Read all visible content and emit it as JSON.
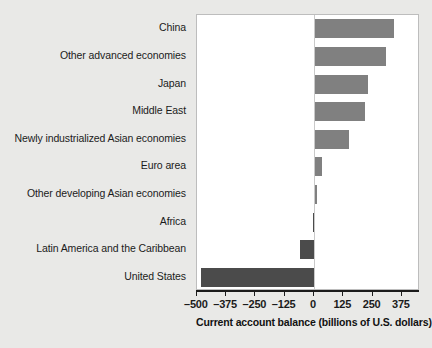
{
  "chart_data": {
    "type": "bar",
    "orientation": "horizontal",
    "title": "",
    "subtitle": "",
    "xlabel": "Current account balance (billions of U.S. dollars)",
    "ylabel": "",
    "xlim": [
      -500,
      432
    ],
    "xticks": [
      -500,
      -375,
      -250,
      -125,
      0,
      125,
      250,
      375
    ],
    "xtick_labels": [
      "–500",
      "–375",
      "–250",
      "–125",
      "0",
      "125",
      "250",
      "375"
    ],
    "grid": false,
    "legend": null,
    "zero_line": 0,
    "categories": [
      "China",
      "Other advanced economies",
      "Japan",
      "Middle East",
      "Newly industrialized Asian economies",
      "Euro area",
      "Other developing Asian economies",
      "Africa",
      "Latin America and the Caribbean",
      "United States"
    ],
    "values": [
      337,
      305,
      225,
      215,
      145,
      30,
      10,
      -5,
      -60,
      -480
    ],
    "colors": {
      "positive_bar": "#808080",
      "negative_bar": "#4b4b4b",
      "plot_background": "#ffffff",
      "page_background": "#e9e9e7",
      "axis": "#1b1b1b",
      "zero_line": "#c9c9c9",
      "plot_border": "#bdbdbd",
      "text": "#1b1b1b"
    }
  }
}
